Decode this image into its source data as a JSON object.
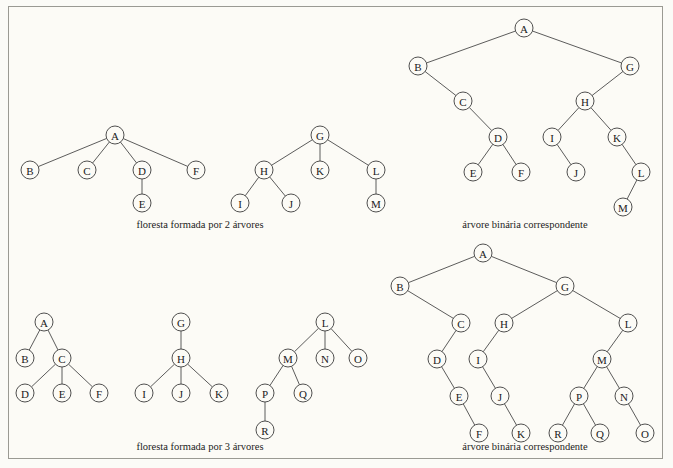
{
  "figure": {
    "background_color": "#fcfbf6",
    "border_color": "#9a9a93",
    "node_stroke_color": "#3c3c3c",
    "edge_color": "#4a4a4a",
    "width": 673,
    "height": 468
  },
  "captions": {
    "forest_two_trees": "floresta formada por 2 árvores",
    "binary_top": "árvore binária correspondente",
    "forest_three_trees": "floresta formada por 3 árvores",
    "binary_bottom": "árvore binária correspondente"
  },
  "panels": {
    "forest_two_trees": {
      "name": "floresta formada por 2 árvores",
      "node_radius": 9,
      "nodes": [
        {
          "id": "A",
          "label": "A",
          "x": 115,
          "y": 135
        },
        {
          "id": "B",
          "label": "B",
          "x": 30,
          "y": 170
        },
        {
          "id": "C",
          "label": "C",
          "x": 87,
          "y": 170
        },
        {
          "id": "D",
          "label": "D",
          "x": 142,
          "y": 170
        },
        {
          "id": "F",
          "label": "F",
          "x": 196,
          "y": 170
        },
        {
          "id": "E",
          "label": "E",
          "x": 142,
          "y": 203
        },
        {
          "id": "G",
          "label": "G",
          "x": 320,
          "y": 135
        },
        {
          "id": "H",
          "label": "H",
          "x": 264,
          "y": 170
        },
        {
          "id": "K",
          "label": "K",
          "x": 320,
          "y": 170
        },
        {
          "id": "L",
          "label": "L",
          "x": 376,
          "y": 170
        },
        {
          "id": "I",
          "label": "I",
          "x": 240,
          "y": 203
        },
        {
          "id": "J",
          "label": "J",
          "x": 291,
          "y": 203
        },
        {
          "id": "M",
          "label": "M",
          "x": 376,
          "y": 203
        }
      ],
      "edges": [
        [
          "A",
          "B"
        ],
        [
          "A",
          "C"
        ],
        [
          "A",
          "D"
        ],
        [
          "A",
          "F"
        ],
        [
          "D",
          "E"
        ],
        [
          "G",
          "H"
        ],
        [
          "G",
          "K"
        ],
        [
          "G",
          "L"
        ],
        [
          "H",
          "I"
        ],
        [
          "H",
          "J"
        ],
        [
          "L",
          "M"
        ]
      ]
    },
    "binary_top": {
      "name": "árvore binária correspondente",
      "node_radius": 9,
      "nodes": [
        {
          "id": "A",
          "label": "A",
          "x": 524,
          "y": 28
        },
        {
          "id": "B",
          "label": "B",
          "x": 418,
          "y": 66
        },
        {
          "id": "G",
          "label": "G",
          "x": 630,
          "y": 66
        },
        {
          "id": "C",
          "label": "C",
          "x": 463,
          "y": 101
        },
        {
          "id": "H",
          "label": "H",
          "x": 585,
          "y": 101
        },
        {
          "id": "D",
          "label": "D",
          "x": 498,
          "y": 137
        },
        {
          "id": "I",
          "label": "I",
          "x": 552,
          "y": 137
        },
        {
          "id": "K",
          "label": "K",
          "x": 617,
          "y": 137
        },
        {
          "id": "E",
          "label": "E",
          "x": 473,
          "y": 172
        },
        {
          "id": "F",
          "label": "F",
          "x": 521,
          "y": 172
        },
        {
          "id": "J",
          "label": "J",
          "x": 576,
          "y": 172
        },
        {
          "id": "L",
          "label": "L",
          "x": 641,
          "y": 172
        },
        {
          "id": "M",
          "label": "M",
          "x": 623,
          "y": 207
        }
      ],
      "edges": [
        [
          "A",
          "B"
        ],
        [
          "A",
          "G"
        ],
        [
          "B",
          "C"
        ],
        [
          "C",
          "D"
        ],
        [
          "D",
          "E"
        ],
        [
          "D",
          "F"
        ],
        [
          "G",
          "H"
        ],
        [
          "H",
          "I"
        ],
        [
          "I",
          "J"
        ],
        [
          "H",
          "K"
        ],
        [
          "K",
          "L"
        ],
        [
          "L",
          "M"
        ]
      ]
    },
    "forest_three_trees": {
      "name": "floresta formada por 3 árvores",
      "node_radius": 9,
      "nodes": [
        {
          "id": "A",
          "label": "A",
          "x": 44,
          "y": 322
        },
        {
          "id": "B",
          "label": "B",
          "x": 25,
          "y": 358
        },
        {
          "id": "C",
          "label": "C",
          "x": 62,
          "y": 358
        },
        {
          "id": "D",
          "label": "D",
          "x": 25,
          "y": 393
        },
        {
          "id": "E",
          "label": "E",
          "x": 62,
          "y": 393
        },
        {
          "id": "F",
          "label": "F",
          "x": 99,
          "y": 393
        },
        {
          "id": "G",
          "label": "G",
          "x": 181,
          "y": 322
        },
        {
          "id": "H",
          "label": "H",
          "x": 181,
          "y": 358
        },
        {
          "id": "I",
          "label": "I",
          "x": 144,
          "y": 393
        },
        {
          "id": "J",
          "label": "J",
          "x": 181,
          "y": 393
        },
        {
          "id": "K",
          "label": "K",
          "x": 219,
          "y": 393
        },
        {
          "id": "L",
          "label": "L",
          "x": 325,
          "y": 322
        },
        {
          "id": "M",
          "label": "M",
          "x": 288,
          "y": 358
        },
        {
          "id": "N",
          "label": "N",
          "x": 325,
          "y": 358
        },
        {
          "id": "O",
          "label": "O",
          "x": 358,
          "y": 358
        },
        {
          "id": "P",
          "label": "P",
          "x": 265,
          "y": 393
        },
        {
          "id": "Q",
          "label": "Q",
          "x": 303,
          "y": 393
        },
        {
          "id": "R",
          "label": "R",
          "x": 265,
          "y": 430
        }
      ],
      "edges": [
        [
          "A",
          "B"
        ],
        [
          "A",
          "C"
        ],
        [
          "C",
          "D"
        ],
        [
          "C",
          "E"
        ],
        [
          "C",
          "F"
        ],
        [
          "G",
          "H"
        ],
        [
          "H",
          "I"
        ],
        [
          "H",
          "J"
        ],
        [
          "H",
          "K"
        ],
        [
          "L",
          "M"
        ],
        [
          "L",
          "N"
        ],
        [
          "L",
          "O"
        ],
        [
          "M",
          "P"
        ],
        [
          "M",
          "Q"
        ],
        [
          "P",
          "R"
        ]
      ]
    },
    "binary_bottom": {
      "name": "árvore binária correspondente",
      "node_radius": 9,
      "nodes": [
        {
          "id": "A",
          "label": "A",
          "x": 483,
          "y": 253
        },
        {
          "id": "B",
          "label": "B",
          "x": 400,
          "y": 286
        },
        {
          "id": "G",
          "label": "G",
          "x": 565,
          "y": 286
        },
        {
          "id": "C",
          "label": "C",
          "x": 461,
          "y": 323
        },
        {
          "id": "H",
          "label": "H",
          "x": 504,
          "y": 323
        },
        {
          "id": "L",
          "label": "L",
          "x": 628,
          "y": 323
        },
        {
          "id": "D",
          "label": "D",
          "x": 437,
          "y": 359
        },
        {
          "id": "I",
          "label": "I",
          "x": 478,
          "y": 359
        },
        {
          "id": "M",
          "label": "M",
          "x": 602,
          "y": 359
        },
        {
          "id": "E",
          "label": "E",
          "x": 459,
          "y": 396
        },
        {
          "id": "J",
          "label": "J",
          "x": 500,
          "y": 396
        },
        {
          "id": "P",
          "label": "P",
          "x": 579,
          "y": 396
        },
        {
          "id": "N",
          "label": "N",
          "x": 624,
          "y": 396
        },
        {
          "id": "F",
          "label": "F",
          "x": 479,
          "y": 433
        },
        {
          "id": "K",
          "label": "K",
          "x": 521,
          "y": 433
        },
        {
          "id": "R",
          "label": "R",
          "x": 558,
          "y": 433
        },
        {
          "id": "Q",
          "label": "Q",
          "x": 600,
          "y": 433
        },
        {
          "id": "O",
          "label": "O",
          "x": 645,
          "y": 433
        }
      ],
      "edges": [
        [
          "A",
          "B"
        ],
        [
          "A",
          "G"
        ],
        [
          "B",
          "C"
        ],
        [
          "C",
          "D"
        ],
        [
          "D",
          "E"
        ],
        [
          "E",
          "F"
        ],
        [
          "G",
          "H"
        ],
        [
          "H",
          "I"
        ],
        [
          "I",
          "J"
        ],
        [
          "J",
          "K"
        ],
        [
          "G",
          "L"
        ],
        [
          "L",
          "M"
        ],
        [
          "M",
          "P"
        ],
        [
          "P",
          "R"
        ],
        [
          "P",
          "Q"
        ],
        [
          "M",
          "N"
        ],
        [
          "N",
          "O"
        ]
      ]
    }
  }
}
